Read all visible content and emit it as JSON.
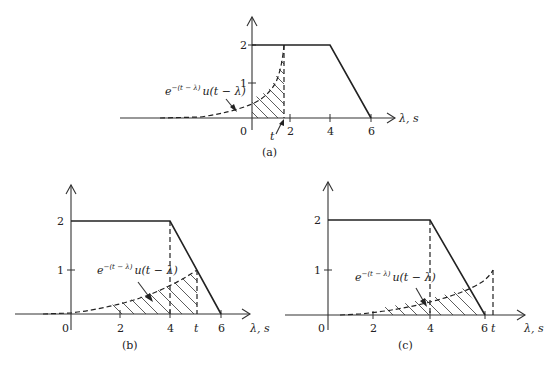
{
  "figure": {
    "panels": [
      {
        "id": "a",
        "caption": "(a)",
        "x_axis_label": "λ, s",
        "x_ticks": [
          "0",
          "2",
          "4",
          "6"
        ],
        "y_ticks": [
          "1",
          "2"
        ],
        "t_label": "t",
        "t_value_approx": 1.7,
        "curve_label_base": "e",
        "curve_label_exp": "−(t − λ)",
        "curve_label_tail": "u(t − λ)"
      },
      {
        "id": "b",
        "caption": "(b)",
        "x_axis_label": "λ, s",
        "x_ticks": [
          "0",
          "2",
          "4",
          "6"
        ],
        "y_ticks": [
          "1",
          "2"
        ],
        "t_label": "t",
        "t_value_approx": 5.1,
        "curve_label_base": "e",
        "curve_label_exp": "−(t − λ)",
        "curve_label_tail": "u(t − λ)"
      },
      {
        "id": "c",
        "caption": "(c)",
        "x_axis_label": "λ, s",
        "x_ticks": [
          "0",
          "2",
          "4",
          "6"
        ],
        "y_ticks": [
          "1",
          "2"
        ],
        "t_label": "t",
        "t_value_approx": 6.3,
        "curve_label_base": "e",
        "curve_label_exp": "−(t − λ)",
        "curve_label_tail": "u(t − λ)"
      }
    ],
    "signal": {
      "description": "trapezoid: 2 for 0≤λ≤4, linearly down to 0 at λ=6",
      "points": [
        [
          0,
          2
        ],
        [
          4,
          2
        ],
        [
          6,
          0
        ]
      ]
    }
  }
}
